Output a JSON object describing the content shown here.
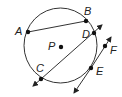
{
  "diagram": {
    "type": "circle-geometry",
    "center": {
      "label": "P",
      "x": 61,
      "y": 47
    },
    "circle": {
      "cx": 60.5,
      "cy": 45.5,
      "rx": 36.5,
      "ry": 37.5
    },
    "points": {
      "A": {
        "label": "A",
        "x": 28,
        "y": 32
      },
      "B": {
        "label": "B",
        "x": 86,
        "y": 21
      },
      "C": {
        "label": "C",
        "x": 41,
        "y": 79
      },
      "D": {
        "label": "D",
        "x": 94,
        "y": 33
      },
      "E": {
        "label": "E",
        "x": 91,
        "y": 68
      },
      "F": {
        "label": "F",
        "x": 105,
        "y": 46
      }
    },
    "segments": [
      {
        "name": "chord-AB",
        "from": "A",
        "to": "B",
        "kind": "segment"
      },
      {
        "name": "secant-CD",
        "from": "C",
        "to": "D",
        "kind": "line"
      },
      {
        "name": "tangent-EF",
        "from": "E",
        "to": "F",
        "kind": "line"
      }
    ]
  }
}
